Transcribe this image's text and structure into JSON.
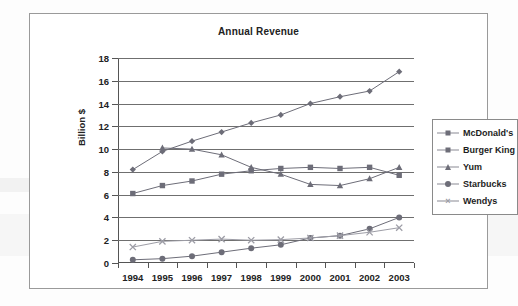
{
  "chart_data": {
    "type": "line",
    "title": "Annual Revenue",
    "xlabel": "",
    "ylabel": "Billion $",
    "categories": [
      "1994",
      "1995",
      "1996",
      "1997",
      "1998",
      "1999",
      "2000",
      "2001",
      "2002",
      "2003"
    ],
    "x": [
      1994,
      1995,
      1996,
      1997,
      1998,
      1999,
      2000,
      2001,
      2002,
      2003
    ],
    "ylim": [
      0,
      18
    ],
    "ytick_values": [
      0,
      2,
      4,
      6,
      8,
      10,
      12,
      14,
      16,
      18
    ],
    "ytick_labels": [
      "0",
      "2",
      "4",
      "6",
      "8",
      "10",
      "12",
      "14",
      "16",
      "18"
    ],
    "grid": true,
    "legend_position": "right",
    "series": [
      {
        "name": "McDonald's",
        "marker": "diamond",
        "color": "#6d6d78",
        "values": [
          8.2,
          9.8,
          10.7,
          11.5,
          12.3,
          13.0,
          14.0,
          14.6,
          15.1,
          16.8
        ]
      },
      {
        "name": "Burger King",
        "marker": "square",
        "color": "#6d6d78",
        "values": [
          6.1,
          6.8,
          7.2,
          7.8,
          8.1,
          8.3,
          8.4,
          8.3,
          8.4,
          7.7
        ]
      },
      {
        "name": "Yum",
        "marker": "triangle",
        "color": "#6d6d78",
        "values": [
          null,
          10.1,
          10.0,
          9.5,
          8.4,
          7.8,
          6.9,
          6.8,
          7.4,
          8.4
        ]
      },
      {
        "name": "Starbucks",
        "marker": "circle",
        "color": "#6d6d78",
        "values": [
          0.28,
          0.38,
          0.6,
          0.95,
          1.3,
          1.6,
          2.2,
          2.4,
          3.0,
          4.0
        ]
      },
      {
        "name": "Wendys",
        "marker": "cross",
        "color": "#9d9da6",
        "values": [
          1.4,
          1.9,
          2.0,
          2.1,
          2.0,
          2.05,
          2.2,
          2.4,
          2.7,
          3.1
        ]
      }
    ]
  },
  "legend": {
    "items": [
      {
        "label": "McDonald's",
        "marker": "diamond"
      },
      {
        "label": "Burger King",
        "marker": "square"
      },
      {
        "label": "Yum",
        "marker": "triangle"
      },
      {
        "label": "Starbucks",
        "marker": "circle"
      },
      {
        "label": "Wendys",
        "marker": "cross"
      }
    ]
  }
}
